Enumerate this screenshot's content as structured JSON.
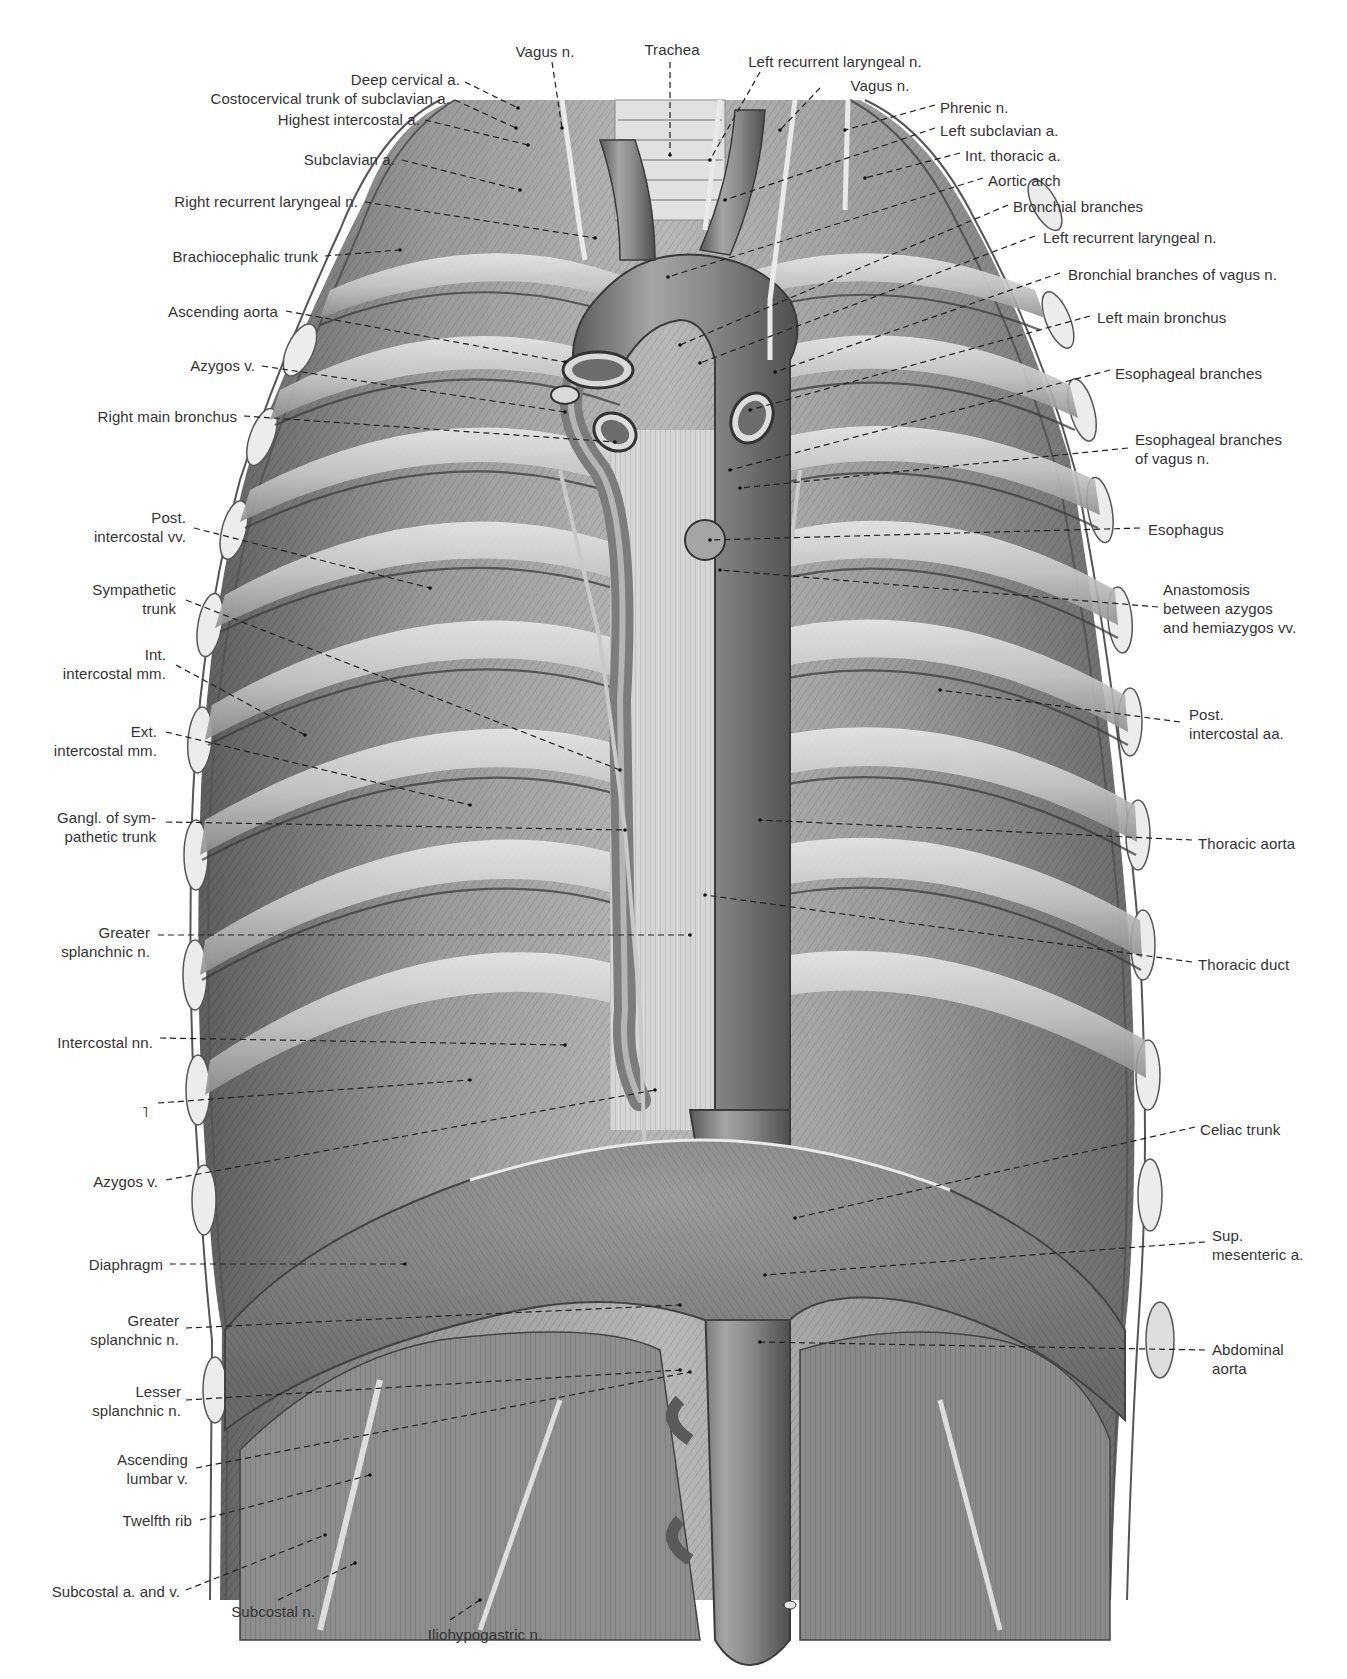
{
  "figure": {
    "colors": {
      "ink": "#333333",
      "tissue_dark": "#5a5a5a",
      "tissue_mid": "#8d8d8d",
      "tissue_light": "#d2d2d2",
      "background": "#ffffff"
    }
  },
  "labels_top": [
    {
      "text": "Vagus n.",
      "x": 545,
      "y": 42,
      "align": "c",
      "lx1": 552,
      "ly1": 62,
      "lx2": 562,
      "ly2": 128
    },
    {
      "text": "Trachea",
      "x": 672,
      "y": 40,
      "align": "c",
      "lx1": 670,
      "ly1": 62,
      "lx2": 670,
      "ly2": 155
    },
    {
      "text": "Left recurrent laryngeal n.",
      "x": 835,
      "y": 52,
      "align": "c",
      "lx1": 760,
      "ly1": 72,
      "lx2": 710,
      "ly2": 160
    },
    {
      "text": "Vagus n.",
      "x": 880,
      "y": 76,
      "align": "c",
      "lx1": 820,
      "ly1": 88,
      "lx2": 780,
      "ly2": 130
    }
  ],
  "labels_left": [
    {
      "text": "Deep cervical a.",
      "x": 460,
      "y": 70,
      "lx1": 465,
      "ly1": 82,
      "lx2": 518,
      "ly2": 108
    },
    {
      "text": "Costocervical trunk of subclavian a.",
      "x": 450,
      "y": 89,
      "lx1": 455,
      "ly1": 100,
      "lx2": 516,
      "ly2": 128
    },
    {
      "text": "Highest intercostal a.",
      "x": 420,
      "y": 110,
      "lx1": 425,
      "ly1": 120,
      "lx2": 528,
      "ly2": 145
    },
    {
      "text": "Subclavian a.",
      "x": 395,
      "y": 150,
      "lx1": 402,
      "ly1": 160,
      "lx2": 520,
      "ly2": 190
    },
    {
      "text": "Right recurrent laryngeal n.",
      "x": 358,
      "y": 192,
      "lx1": 365,
      "ly1": 202,
      "lx2": 595,
      "ly2": 238
    },
    {
      "text": "Brachiocephalic trunk",
      "x": 318,
      "y": 247,
      "lx1": 325,
      "ly1": 256,
      "lx2": 400,
      "ly2": 250
    },
    {
      "text": "Ascending aorta",
      "x": 278,
      "y": 302,
      "lx1": 286,
      "ly1": 311,
      "lx2": 565,
      "ly2": 362
    },
    {
      "text": "Azygos v.",
      "x": 255,
      "y": 356,
      "lx1": 262,
      "ly1": 366,
      "lx2": 565,
      "ly2": 412
    },
    {
      "text": "Right main bronchus",
      "x": 237,
      "y": 407,
      "lx1": 244,
      "ly1": 416,
      "lx2": 615,
      "ly2": 442
    },
    {
      "text": "Post.\nintercostal vv.",
      "x": 186,
      "y": 508,
      "lx1": 194,
      "ly1": 528,
      "lx2": 430,
      "ly2": 588
    },
    {
      "text": "Sympathetic\ntrunk",
      "x": 176,
      "y": 580,
      "lx1": 186,
      "ly1": 600,
      "lx2": 620,
      "ly2": 770
    },
    {
      "text": "Int.\nintercostal mm.",
      "x": 166,
      "y": 645,
      "lx1": 176,
      "ly1": 665,
      "lx2": 305,
      "ly2": 735
    },
    {
      "text": "Ext.\nintercostal mm.",
      "x": 157,
      "y": 722,
      "lx1": 166,
      "ly1": 732,
      "lx2": 470,
      "ly2": 805
    },
    {
      "text": "Gangl. of sym-\npathetic trunk",
      "x": 156,
      "y": 808,
      "lx1": 166,
      "ly1": 822,
      "lx2": 625,
      "ly2": 830
    },
    {
      "text": "Greater\nsplanchnic n.",
      "x": 150,
      "y": 923,
      "lx1": 158,
      "ly1": 935,
      "lx2": 690,
      "ly2": 935
    },
    {
      "text": "Intercostal nn.",
      "x": 153,
      "y": 1033,
      "lx1": 160,
      "ly1": 1038,
      "lx2": 565,
      "ly2": 1045
    },
    {
      "text": "˥",
      "x": 148,
      "y": 1102,
      "lx1": 158,
      "ly1": 1103,
      "lx2": 470,
      "ly2": 1080
    },
    {
      "text": "Azygos v.",
      "x": 158,
      "y": 1172,
      "lx1": 166,
      "ly1": 1180,
      "lx2": 655,
      "ly2": 1090
    },
    {
      "text": "Diaphragm",
      "x": 163,
      "y": 1255,
      "lx1": 170,
      "ly1": 1264,
      "lx2": 405,
      "ly2": 1264
    },
    {
      "text": "Greater\nsplanchnic n.",
      "x": 179,
      "y": 1311,
      "lx1": 186,
      "ly1": 1328,
      "lx2": 680,
      "ly2": 1305
    },
    {
      "text": "Lesser\nsplanchnic n.",
      "x": 181,
      "y": 1382,
      "lx1": 186,
      "ly1": 1400,
      "lx2": 680,
      "ly2": 1370
    },
    {
      "text": "Ascending\nlumbar v.",
      "x": 188,
      "y": 1450,
      "lx1": 196,
      "ly1": 1468,
      "lx2": 690,
      "ly2": 1372
    },
    {
      "text": "Twelfth rib",
      "x": 192,
      "y": 1511,
      "lx1": 200,
      "ly1": 1520,
      "lx2": 370,
      "ly2": 1475
    },
    {
      "text": "Subcostal a. and v.",
      "x": 180,
      "y": 1582,
      "lx1": 186,
      "ly1": 1590,
      "lx2": 325,
      "ly2": 1535
    },
    {
      "text": "Subcostal n.",
      "x": 315,
      "y": 1602,
      "lx1": 278,
      "ly1": 1600,
      "lx2": 355,
      "ly2": 1563
    },
    {
      "text": "Iliohypogastric n.",
      "x": 485,
      "y": 1625,
      "align": "c",
      "lx1": 450,
      "ly1": 1620,
      "lx2": 480,
      "ly2": 1600
    }
  ],
  "labels_right": [
    {
      "text": "Phrenic n.",
      "x": 940,
      "y": 98,
      "lx1": 935,
      "ly1": 105,
      "lx2": 845,
      "ly2": 130
    },
    {
      "text": "Left subclavian a.",
      "x": 940,
      "y": 121,
      "lx1": 935,
      "ly1": 128,
      "lx2": 725,
      "ly2": 200
    },
    {
      "text": "Int. thoracic a.",
      "x": 965,
      "y": 146,
      "lx1": 960,
      "ly1": 153,
      "lx2": 865,
      "ly2": 178
    },
    {
      "text": "Aortic arch",
      "x": 988,
      "y": 171,
      "lx1": 983,
      "ly1": 178,
      "lx2": 668,
      "ly2": 277
    },
    {
      "text": "Bronchial branches",
      "x": 1013,
      "y": 197,
      "lx1": 1008,
      "ly1": 205,
      "lx2": 680,
      "ly2": 345
    },
    {
      "text": "Left recurrent laryngeal n.",
      "x": 1043,
      "y": 228,
      "lx1": 1035,
      "ly1": 236,
      "lx2": 700,
      "ly2": 363
    },
    {
      "text": "Bronchial branches of vagus n.",
      "x": 1068,
      "y": 265,
      "lx1": 1060,
      "ly1": 273,
      "lx2": 775,
      "ly2": 372
    },
    {
      "text": "Left main bronchus",
      "x": 1097,
      "y": 308,
      "lx1": 1090,
      "ly1": 316,
      "lx2": 750,
      "ly2": 410
    },
    {
      "text": "Esophageal branches",
      "x": 1115,
      "y": 364,
      "lx1": 1110,
      "ly1": 370,
      "lx2": 730,
      "ly2": 470
    },
    {
      "text": "Esophageal branches\nof vagus n.",
      "x": 1135,
      "y": 430,
      "lx1": 1128,
      "ly1": 448,
      "lx2": 740,
      "ly2": 488
    },
    {
      "text": "Esophagus",
      "x": 1148,
      "y": 520,
      "lx1": 1140,
      "ly1": 528,
      "lx2": 710,
      "ly2": 540
    },
    {
      "text": "Anastomosis\nbetween azygos\nand hemiazygos vv.",
      "x": 1163,
      "y": 580,
      "lx1": 1158,
      "ly1": 607,
      "lx2": 720,
      "ly2": 570
    },
    {
      "text": "Post.\nintercostal aa.",
      "x": 1189,
      "y": 705,
      "lx1": 1180,
      "ly1": 722,
      "lx2": 940,
      "ly2": 690
    },
    {
      "text": "Thoracic aorta",
      "x": 1198,
      "y": 834,
      "lx1": 1192,
      "ly1": 840,
      "lx2": 760,
      "ly2": 820
    },
    {
      "text": "Thoracic duct",
      "x": 1198,
      "y": 955,
      "lx1": 1192,
      "ly1": 962,
      "lx2": 705,
      "ly2": 895
    },
    {
      "text": "Celiac trunk",
      "x": 1200,
      "y": 1120,
      "lx1": 1195,
      "ly1": 1127,
      "lx2": 795,
      "ly2": 1218
    },
    {
      "text": "Sup.\nmesenteric a.",
      "x": 1212,
      "y": 1226,
      "lx1": 1205,
      "ly1": 1242,
      "lx2": 765,
      "ly2": 1275
    },
    {
      "text": "Abdominal\naorta",
      "x": 1212,
      "y": 1340,
      "lx1": 1205,
      "ly1": 1350,
      "lx2": 760,
      "ly2": 1342
    }
  ]
}
